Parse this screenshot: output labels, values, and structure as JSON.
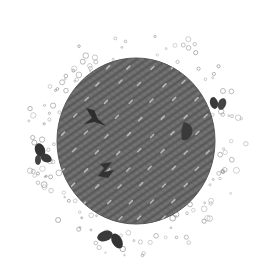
{
  "image": {
    "title": "Pencil illustration of textured dark circle surrounded by bubbles and leaf shapes",
    "width": 265,
    "height": 279,
    "background": "#ffffff"
  },
  "disk": {
    "cx": 136,
    "cy": 141,
    "rx": 79,
    "ry": 83,
    "fill": "#6b6b6b",
    "texture_color": "#4a4a4a",
    "highlight_color": "#b8b8b8"
  },
  "inner_marks": [
    {
      "name": "dark-bird-mark",
      "x": 92,
      "y": 118,
      "color": "#2e2e2e"
    },
    {
      "name": "dark-leaf-mark",
      "x": 188,
      "y": 130,
      "color": "#3a3a3a"
    },
    {
      "name": "dark-z-mark",
      "x": 106,
      "y": 170,
      "color": "#333333"
    }
  ],
  "outer_leaves": [
    {
      "name": "leaf-right",
      "x": 218,
      "y": 104,
      "color": "#3a3a3a"
    },
    {
      "name": "leaf-left",
      "x": 42,
      "y": 155,
      "color": "#3a3a3a"
    },
    {
      "name": "leaf-bottom",
      "x": 112,
      "y": 240,
      "color": "#3a3a3a"
    }
  ],
  "bubbles": {
    "color": "#9a9a9a",
    "count": 140
  }
}
